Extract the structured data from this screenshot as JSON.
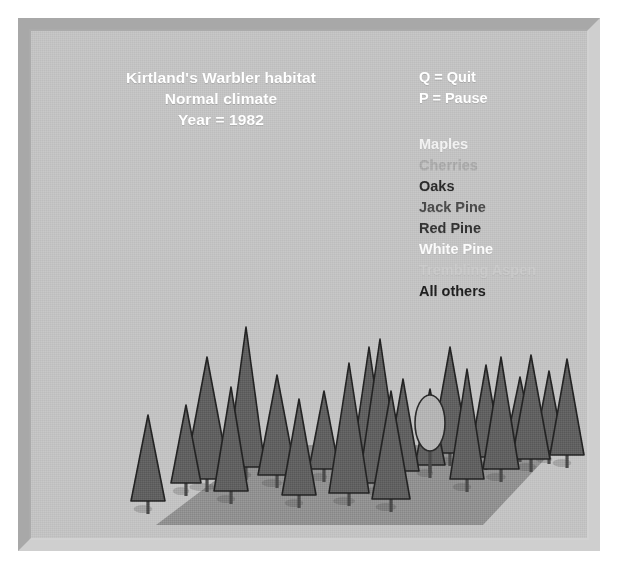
{
  "window": {
    "background_color": "#c2c2c2",
    "frame_color": "#b9b9b9"
  },
  "title": {
    "line1": "Kirtland's Warbler habitat",
    "line2": "Normal climate",
    "line3": "Year = 1982",
    "color": "#ffffff"
  },
  "keys": [
    {
      "label": "Q = Quit",
      "color": "#ffffff"
    },
    {
      "label": "P = Pause",
      "color": "#ffffff"
    }
  ],
  "legend": {
    "items": [
      {
        "label": "Maples",
        "color": "#f2f2f2"
      },
      {
        "label": "Cherries",
        "color": "#a8a8a8"
      },
      {
        "label": "Oaks",
        "color": "#2b2b2b"
      },
      {
        "label": "Jack Pine",
        "color": "#4a4a4a"
      },
      {
        "label": "Red Pine",
        "color": "#333333"
      },
      {
        "label": "White Pine",
        "color": "#fbfbfb"
      },
      {
        "label": "Trembling Aspen",
        "color": "#c9c9c9"
      },
      {
        "label": "All others",
        "color": "#1f1f1f"
      }
    ]
  },
  "scene": {
    "ground": {
      "color": "#8f8f8f",
      "points": "125,494 231,414 527,414 452,494"
    },
    "conifer_fill": "#5e5e5e",
    "conifer_stroke": "#232323",
    "trunk_color": "#4a4a4a",
    "deciduous_fill": "#b3b3b3",
    "deciduous_stroke": "#2b2b2b",
    "conifers": [
      {
        "x": 117,
        "base": 470,
        "half": 17,
        "height": 86
      },
      {
        "x": 155,
        "base": 452,
        "half": 15,
        "height": 78
      },
      {
        "x": 176,
        "base": 448,
        "half": 23,
        "height": 122
      },
      {
        "x": 200,
        "base": 460,
        "half": 17,
        "height": 104
      },
      {
        "x": 215,
        "base": 436,
        "half": 19,
        "height": 140
      },
      {
        "x": 246,
        "base": 444,
        "half": 19,
        "height": 100
      },
      {
        "x": 268,
        "base": 464,
        "half": 17,
        "height": 96
      },
      {
        "x": 293,
        "base": 438,
        "half": 15,
        "height": 78
      },
      {
        "x": 318,
        "base": 462,
        "half": 20,
        "height": 130
      },
      {
        "x": 338,
        "base": 432,
        "half": 17,
        "height": 116
      },
      {
        "x": 349,
        "base": 452,
        "half": 21,
        "height": 144
      },
      {
        "x": 372,
        "base": 440,
        "half": 16,
        "height": 92
      },
      {
        "x": 360,
        "base": 468,
        "half": 19,
        "height": 108
      },
      {
        "x": 399,
        "base": 434,
        "half": 15,
        "height": 76
      },
      {
        "x": 419,
        "base": 422,
        "half": 19,
        "height": 106
      },
      {
        "x": 436,
        "base": 448,
        "half": 17,
        "height": 110
      },
      {
        "x": 455,
        "base": 426,
        "half": 16,
        "height": 92
      },
      {
        "x": 470,
        "base": 438,
        "half": 18,
        "height": 112
      },
      {
        "x": 489,
        "base": 418,
        "half": 15,
        "height": 72
      },
      {
        "x": 500,
        "base": 428,
        "half": 19,
        "height": 104
      },
      {
        "x": 518,
        "base": 420,
        "half": 15,
        "height": 80
      },
      {
        "x": 536,
        "base": 424,
        "half": 17,
        "height": 96
      }
    ],
    "deciduous": [
      {
        "cx": 399,
        "cy": 392,
        "rx": 15,
        "ry": 28
      }
    ]
  }
}
